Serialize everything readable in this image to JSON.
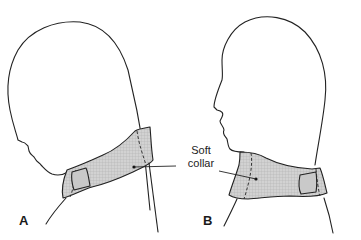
{
  "figure": {
    "panels": [
      {
        "id": "A",
        "label": "A",
        "description": "Head in profile facing left, tilted forward, wearing a soft cervical collar with a velcro fastener at the front"
      },
      {
        "id": "B",
        "label": "B",
        "description": "Head in profile facing left, upright, wearing a soft cervical collar with a velcro fastener at the back"
      }
    ],
    "callout": {
      "line1": "Soft",
      "line2": "collar"
    },
    "colors": {
      "line": "#222222",
      "collar_fill": "#cfcfcf",
      "collar_mesh": "#b5b5b5",
      "background": "#ffffff"
    }
  }
}
